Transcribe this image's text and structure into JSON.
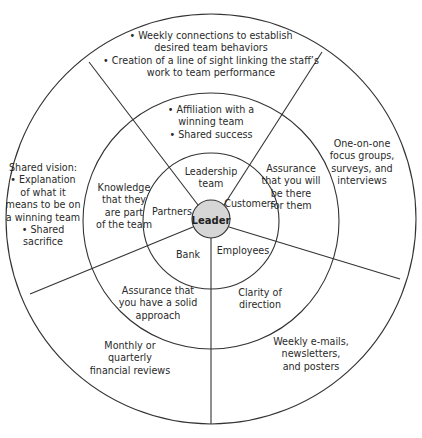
{
  "diagram": {
    "center": "Leader",
    "colors": {
      "line": "#333333",
      "leader_fill": "#d6d6d6",
      "background": "#ffffff"
    },
    "inner_ring": {
      "segments": [
        {
          "label": "Leadership team",
          "lines": [
            "Leadership",
            "team"
          ]
        },
        {
          "label": "Customers",
          "lines": [
            "Customers"
          ]
        },
        {
          "label": "Employees",
          "lines": [
            "Employees"
          ]
        },
        {
          "label": "Bank",
          "lines": [
            "Bank"
          ]
        },
        {
          "label": "Partners",
          "lines": [
            "Partners"
          ]
        }
      ]
    },
    "middle_ring": {
      "segments": [
        {
          "stakeholder": "Leadership team",
          "lines": [
            "• Affiliation with a",
            "winning team",
            "• Shared success"
          ]
        },
        {
          "stakeholder": "Customers",
          "lines": [
            "Assurance",
            "that you will",
            "be there",
            "for them"
          ]
        },
        {
          "stakeholder": "Employees",
          "lines": [
            "Clarity of",
            "direction"
          ]
        },
        {
          "stakeholder": "Bank",
          "lines": [
            "Assurance that",
            "you have a solid",
            "approach"
          ]
        },
        {
          "stakeholder": "Partners",
          "lines": [
            "Knowledge",
            "that they",
            "are part",
            "of the team"
          ]
        }
      ]
    },
    "outer_ring": {
      "segments": [
        {
          "stakeholder": "Leadership team",
          "lines": [
            "• Weekly connections to establish",
            "desired team behaviors",
            "• Creation of a line of sight linking the staff’s",
            "work to team performance"
          ]
        },
        {
          "stakeholder": "Customers",
          "lines": [
            "One-on-one",
            "focus groups,",
            "surveys, and",
            "interviews"
          ]
        },
        {
          "stakeholder": "Employees",
          "lines": [
            "Weekly e-mails,",
            "newsletters,",
            "and posters"
          ]
        },
        {
          "stakeholder": "Bank",
          "lines": [
            "Monthly or",
            "quarterly",
            "financial reviews"
          ]
        },
        {
          "stakeholder": "Partners",
          "lines": [
            "Shared vision:",
            "• Explanation",
            "of what it",
            "means to be on",
            "a winning team",
            "• Shared",
            "sacrifice"
          ]
        }
      ]
    }
  }
}
